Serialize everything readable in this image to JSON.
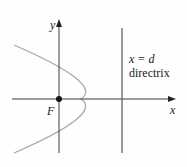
{
  "diagram": {
    "axis_labels": {
      "x": "x",
      "y": "y"
    },
    "focus_label": "F",
    "directrix_equation": "x = d",
    "directrix_label": "directrix",
    "colors": {
      "axes": "#3a3a3a",
      "parabola": "#a8a8a8",
      "directrix": "#555555",
      "focus": "#111111"
    }
  }
}
